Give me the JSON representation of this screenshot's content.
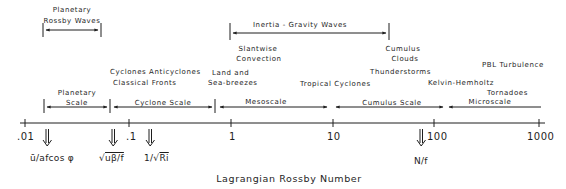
{
  "diagram": {
    "axis": {
      "title": "Lagrangian Rossby Number",
      "ticks": [
        ".01",
        ".1",
        "1",
        "10",
        "100",
        "1000"
      ]
    },
    "wave_ranges": [
      {
        "label_line1": "Planetary",
        "label_line2": "Rossby Waves"
      },
      {
        "label_line1": "Inertia - Gravity  Waves"
      }
    ],
    "phenomena": {
      "cyclones_anticyclones": "Cyclones  Anticyclones",
      "classical_fronts": "Classical  Fronts",
      "slantwise_1": "Slantwise",
      "slantwise_2": "Convection",
      "land_sea_1": "Land and",
      "land_sea_2": "Sea-breezes",
      "tropical_cyclones": "Tropical Cyclones",
      "thunderstorms": "Thunderstorms",
      "cumulus_1": "Cumulus",
      "cumulus_2": "Clouds",
      "kelvin_helmholtz": "Kelvin-Hemholtz",
      "pbl_turbulence": "PBL Turbulence",
      "tornadoes": "Tornadoes"
    },
    "scales": [
      {
        "label_line1": "Planetary",
        "label_line2": "Scale"
      },
      {
        "label": "Cyclone  Scale"
      },
      {
        "label": "Mesoscale"
      },
      {
        "label": "Cumulus  Scale"
      },
      {
        "label": "Microscale"
      }
    ],
    "markers": [
      {
        "label": "ū/afcos φ"
      },
      {
        "label_root": "√",
        "label_rest": "uβ/f"
      },
      {
        "label_pre": "1/",
        "label_root": "√",
        "label_rest": "Ri"
      },
      {
        "label": "N/f"
      }
    ],
    "colors": {
      "ink": "#1e1e1e",
      "background": "#ffffff"
    }
  }
}
